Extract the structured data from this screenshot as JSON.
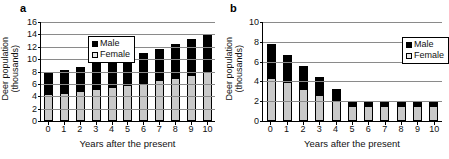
{
  "figure": {
    "panels": [
      {
        "label": "a",
        "legend_position": "top-left",
        "legend": {
          "male": "Male",
          "female": "Female"
        }
      },
      {
        "label": "b",
        "legend_position": "top-right",
        "legend": {
          "male": "Male",
          "female": "Female"
        }
      }
    ],
    "colors": {
      "male": "#000000",
      "female": "#c9c9c9",
      "gridline": "#8a8a8a",
      "axis": "#000000"
    }
  },
  "chart_data": [
    {
      "type": "bar",
      "id": "panel-a",
      "panel_label": "a",
      "title": "",
      "stacked": true,
      "xlabel": "Years after the present",
      "ylabel": "Deer population (thousands)",
      "ylabel_line1": "Deer population",
      "ylabel_line2": "(thousands)",
      "categories": [
        "0",
        "1",
        "2",
        "3",
        "4",
        "5",
        "6",
        "7",
        "8",
        "9",
        "10"
      ],
      "ylim": [
        0,
        16
      ],
      "yticks": [
        0,
        2,
        4,
        6,
        8,
        10,
        12,
        14,
        16
      ],
      "grid": true,
      "legend": [
        "Male",
        "Female"
      ],
      "legend_position": "upper left",
      "series": [
        {
          "name": "Female",
          "values": [
            4.3,
            4.6,
            4.9,
            5.2,
            5.5,
            5.9,
            6.2,
            6.6,
            7.0,
            7.5,
            8.0
          ]
        },
        {
          "name": "Male",
          "values": [
            3.5,
            3.6,
            3.9,
            4.1,
            4.3,
            4.5,
            4.8,
            5.1,
            5.4,
            5.7,
            6.1
          ]
        }
      ],
      "totals": [
        7.8,
        8.2,
        8.8,
        9.3,
        9.8,
        10.4,
        11.0,
        11.7,
        12.4,
        13.2,
        14.1
      ]
    },
    {
      "type": "bar",
      "id": "panel-b",
      "panel_label": "b",
      "title": "",
      "stacked": true,
      "xlabel": "Years after the present",
      "ylabel": "Deer population (thousands)",
      "ylabel_line1": "Deer population",
      "ylabel_line2": "(thousands)",
      "categories": [
        "0",
        "1",
        "2",
        "3",
        "4",
        "5",
        "6",
        "7",
        "8",
        "9",
        "10"
      ],
      "ylim": [
        0,
        10
      ],
      "yticks": [
        0,
        2,
        4,
        6,
        8,
        10
      ],
      "grid": true,
      "legend": [
        "Male",
        "Female"
      ],
      "legend_position": "upper right",
      "series": [
        {
          "name": "Female",
          "values": [
            4.3,
            3.9,
            3.2,
            2.6,
            2.0,
            1.5,
            1.5,
            1.5,
            1.5,
            1.5,
            1.5
          ]
        },
        {
          "name": "Male",
          "values": [
            3.5,
            2.8,
            2.4,
            1.8,
            1.2,
            0.4,
            0.4,
            0.4,
            0.4,
            0.4,
            0.4
          ]
        }
      ],
      "totals": [
        7.8,
        6.7,
        5.6,
        4.4,
        3.2,
        1.9,
        1.9,
        1.9,
        1.9,
        1.9,
        1.9
      ]
    }
  ]
}
